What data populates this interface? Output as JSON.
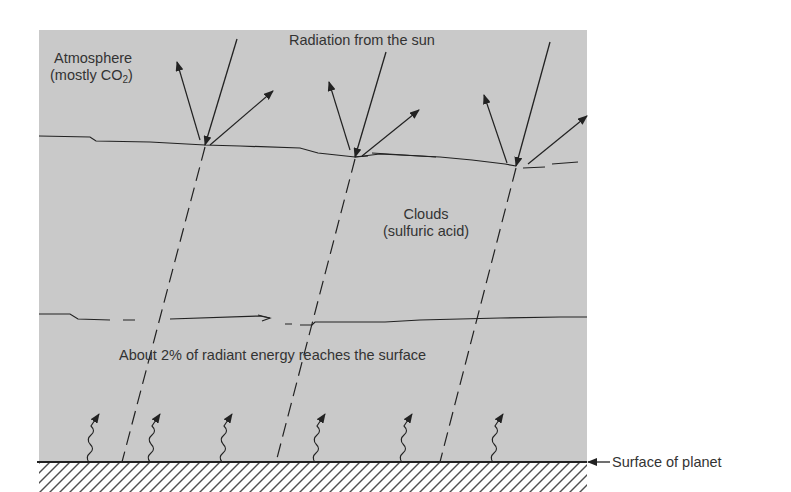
{
  "diagram": {
    "labels": {
      "atmosphere_line1": "Atmosphere",
      "atmosphere_line2_prefix": "(mostly CO",
      "atmosphere_line2_sub": "2",
      "atmosphere_line2_suffix": ")",
      "radiation": "Radiation from the sun",
      "clouds_line1": "Clouds",
      "clouds_line2": "(sulfuric acid)",
      "energy": "About 2% of radiant energy reaches the surface",
      "surface": "Surface of planet"
    },
    "layers": [
      "Atmosphere (mostly CO2)",
      "Clouds (sulfuric acid)",
      "Surface of planet"
    ],
    "rays": [
      {
        "name": "ray-1",
        "entry_x": 205,
        "entry_y": 145,
        "surface_x": 122
      },
      {
        "name": "ray-2",
        "entry_x": 355,
        "entry_y": 157,
        "surface_x": 276
      },
      {
        "name": "ray-3",
        "entry_x": 516,
        "entry_y": 166,
        "surface_x": 440
      }
    ],
    "heat_arrows_x": [
      92,
      155,
      229,
      320,
      406,
      495
    ],
    "colors": {
      "panel": "#c9c9c9",
      "ink": "#222222",
      "background": "#ffffff"
    }
  }
}
